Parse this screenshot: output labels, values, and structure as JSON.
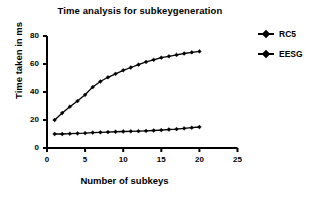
{
  "chart_data": {
    "type": "line",
    "title": "Time analysis for subkeygeneration",
    "xlabel": "Number of subkeys",
    "ylabel": "Time taken in ms",
    "xlim": [
      0,
      25
    ],
    "ylim": [
      0,
      80
    ],
    "xticks": [
      0,
      5,
      10,
      15,
      20,
      25
    ],
    "yticks": [
      0,
      20,
      40,
      60,
      80
    ],
    "grid": false,
    "legend_position": "right",
    "x": [
      1,
      2,
      3,
      4,
      5,
      6,
      7,
      8,
      9,
      10,
      11,
      12,
      13,
      14,
      15,
      16,
      17,
      18,
      19,
      20
    ],
    "series": [
      {
        "name": "RC5",
        "marker": "diamond",
        "color": "#000000",
        "values": [
          10,
          10,
          10.2,
          10.4,
          10.6,
          11,
          11.2,
          11.4,
          11.6,
          11.8,
          11.9,
          12,
          12.2,
          12.5,
          12.8,
          13.2,
          13.5,
          14,
          14.5,
          15
        ]
      },
      {
        "name": "EESG",
        "marker": "diamond",
        "color": "#000000",
        "values": [
          20,
          25,
          29.5,
          33.5,
          38,
          43.5,
          47.5,
          50.5,
          53,
          55.5,
          57.5,
          59.5,
          61.5,
          63,
          64.5,
          65.5,
          66.5,
          67.5,
          68.3,
          69
        ]
      }
    ]
  },
  "legend": {
    "entries": [
      {
        "label": "RC5"
      },
      {
        "label": "EESG"
      }
    ]
  },
  "axis_tick_text": {
    "y": [
      "0",
      "20",
      "40",
      "60",
      "80"
    ],
    "x": [
      "0",
      "5",
      "10",
      "15",
      "20",
      "25"
    ]
  }
}
